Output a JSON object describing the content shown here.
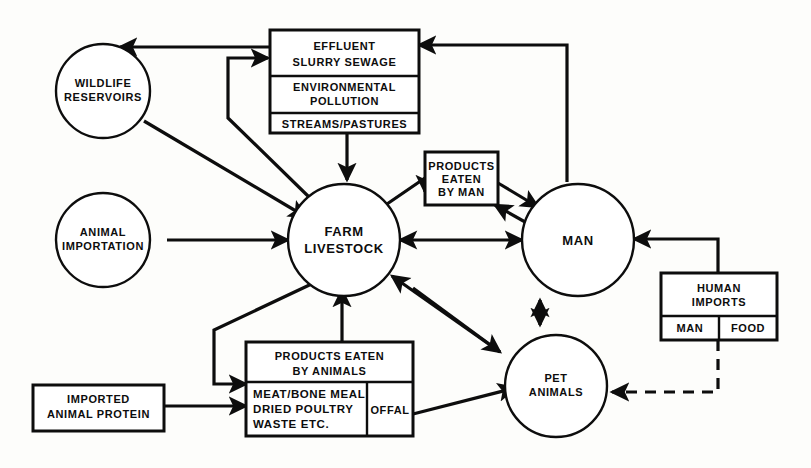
{
  "diagram": {
    "colors": {
      "ink": "#0d0d0d",
      "paper": "#fdfdfb"
    },
    "nodes": {
      "wildlife": {
        "label_line1": "WILDLIFE",
        "label_line2": "RESERVOIRS"
      },
      "animal_importation": {
        "label_line1": "ANIMAL",
        "label_line2": "IMPORTATION"
      },
      "farm_livestock": {
        "label_line1": "FARM",
        "label_line2": "LIVESTOCK"
      },
      "man": {
        "label_line1": "MAN"
      },
      "pet_animals": {
        "label_line1": "PET",
        "label_line2": "ANIMALS"
      },
      "effluent": {
        "row1_line1": "EFFLUENT",
        "row1_line2": "SLURRY SEWAGE",
        "row2_line1": "ENVIRONMENTAL",
        "row2_line2": "POLLUTION",
        "row3_line1": "STREAMS/PASTURES"
      },
      "products_eaten_by_man": {
        "line1": "PRODUCTS",
        "line2": "EATEN",
        "line3": "BY MAN"
      },
      "human_imports": {
        "header_line1": "HUMAN",
        "header_line2": "IMPORTS",
        "cell_left": "MAN",
        "cell_right": "FOOD"
      },
      "products_eaten_by_animals": {
        "header_line1": "PRODUCTS EATEN",
        "header_line2": "BY ANIMALS",
        "cell_left_line1": "MEAT/BONE MEAL",
        "cell_left_line2": "DRIED POULTRY",
        "cell_left_line3": "WASTE ETC.",
        "cell_right": "OFFAL"
      },
      "imported_animal_protein": {
        "line1": "IMPORTED",
        "line2": "ANIMAL PROTEIN"
      }
    },
    "edges": [
      {
        "id": "effluent-to-wildlife",
        "from": "effluent",
        "to": "wildlife",
        "style": "solid",
        "direction": "one-way"
      },
      {
        "id": "wildlife-to-farm-livestock",
        "from": "wildlife",
        "to": "farm_livestock",
        "style": "solid",
        "direction": "one-way"
      },
      {
        "id": "farm-livestock-to-effluent",
        "from": "farm_livestock",
        "to": "effluent",
        "style": "solid",
        "direction": "one-way"
      },
      {
        "id": "streams-pastures-to-farm-livestock",
        "from": "effluent",
        "to": "farm_livestock",
        "style": "solid",
        "direction": "one-way"
      },
      {
        "id": "man-to-effluent",
        "from": "man",
        "to": "effluent",
        "style": "solid",
        "direction": "one-way"
      },
      {
        "id": "animal-importation-to-farm-livestock",
        "from": "animal_importation",
        "to": "farm_livestock",
        "style": "solid",
        "direction": "one-way"
      },
      {
        "id": "farm-livestock-to-products-eaten-by-man",
        "from": "farm_livestock",
        "to": "products_eaten_by_man",
        "style": "solid",
        "direction": "one-way"
      },
      {
        "id": "products-eaten-by-man-to-man",
        "from": "products_eaten_by_man",
        "to": "man",
        "style": "solid",
        "direction": "two-way"
      },
      {
        "id": "farm-livestock-to-man",
        "from": "farm_livestock",
        "to": "man",
        "style": "solid",
        "direction": "two-way"
      },
      {
        "id": "human-imports-to-man",
        "from": "human_imports",
        "to": "man",
        "style": "solid",
        "direction": "one-way"
      },
      {
        "id": "human-imports-to-pet-animals",
        "from": "human_imports",
        "to": "pet_animals",
        "style": "dashed",
        "direction": "one-way"
      },
      {
        "id": "man-to-pet-animals",
        "from": "man",
        "to": "pet_animals",
        "style": "solid",
        "direction": "two-way"
      },
      {
        "id": "pet-animals-to-farm-livestock",
        "from": "pet_animals",
        "to": "farm_livestock",
        "style": "solid",
        "direction": "one-way"
      },
      {
        "id": "farm-livestock-to-pet-animals",
        "from": "farm_livestock",
        "to": "pet_animals",
        "style": "solid",
        "direction": "one-way"
      },
      {
        "id": "farm-livestock-to-products-eaten-by-animals",
        "from": "farm_livestock",
        "to": "products_eaten_by_animals",
        "style": "solid",
        "direction": "one-way"
      },
      {
        "id": "products-eaten-by-animals-to-farm-livestock",
        "from": "products_eaten_by_animals",
        "to": "farm_livestock",
        "style": "solid",
        "direction": "one-way"
      },
      {
        "id": "imported-animal-protein-to-products-eaten-by-animals",
        "from": "imported_animal_protein",
        "to": "products_eaten_by_animals",
        "style": "solid",
        "direction": "one-way"
      },
      {
        "id": "offal-to-pet-animals",
        "from": "products_eaten_by_animals",
        "to": "pet_animals",
        "style": "solid",
        "direction": "one-way"
      }
    ]
  }
}
